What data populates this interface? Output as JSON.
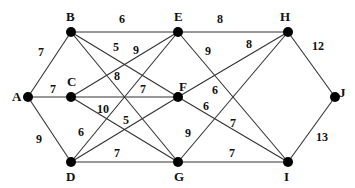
{
  "diagram": {
    "type": "weighted-undirected-graph",
    "nodes": [
      {
        "id": "A",
        "label": "A",
        "x": 28,
        "y": 97,
        "lx": 12,
        "ly": 101
      },
      {
        "id": "B",
        "label": "B",
        "x": 71,
        "y": 32,
        "lx": 66,
        "ly": 21
      },
      {
        "id": "C",
        "label": "C",
        "x": 71,
        "y": 97,
        "lx": 67,
        "ly": 86
      },
      {
        "id": "D",
        "label": "D",
        "x": 71,
        "y": 162,
        "lx": 66,
        "ly": 181
      },
      {
        "id": "E",
        "label": "E",
        "x": 178,
        "y": 32,
        "lx": 174,
        "ly": 21
      },
      {
        "id": "F",
        "label": "F",
        "x": 178,
        "y": 97,
        "lx": 179,
        "ly": 91
      },
      {
        "id": "G",
        "label": "G",
        "x": 178,
        "y": 162,
        "lx": 174,
        "ly": 181
      },
      {
        "id": "H",
        "label": "H",
        "x": 288,
        "y": 32,
        "lx": 280,
        "ly": 21
      },
      {
        "id": "I",
        "label": "I",
        "x": 288,
        "y": 162,
        "lx": 284,
        "ly": 181
      },
      {
        "id": "J",
        "label": "J",
        "x": 335,
        "y": 97,
        "lx": 339,
        "ly": 97
      }
    ],
    "edges": [
      {
        "from": "A",
        "to": "B",
        "weight": "7",
        "lx": 38,
        "ly": 56
      },
      {
        "from": "A",
        "to": "C",
        "weight": "7",
        "lx": 50,
        "ly": 93
      },
      {
        "from": "A",
        "to": "D",
        "weight": "9",
        "lx": 36,
        "ly": 143
      },
      {
        "from": "B",
        "to": "E",
        "weight": "6",
        "lx": 119,
        "ly": 23
      },
      {
        "from": "B",
        "to": "F",
        "weight": "5",
        "lx": 113,
        "ly": 51
      },
      {
        "from": "B",
        "to": "G",
        "weight": "8",
        "lx": 114,
        "ly": 80
      },
      {
        "from": "C",
        "to": "E",
        "weight": "9",
        "lx": 133,
        "ly": 54
      },
      {
        "from": "C",
        "to": "F",
        "weight": "7",
        "lx": 140,
        "ly": 93
      },
      {
        "from": "C",
        "to": "G",
        "weight": "10",
        "lx": 97,
        "ly": 113
      },
      {
        "from": "D",
        "to": "E",
        "weight": "6",
        "lx": 78,
        "ly": 136
      },
      {
        "from": "D",
        "to": "F",
        "weight": "5",
        "lx": 123,
        "ly": 124
      },
      {
        "from": "D",
        "to": "G",
        "weight": "7",
        "lx": 114,
        "ly": 157
      },
      {
        "from": "E",
        "to": "H",
        "weight": "8",
        "lx": 217,
        "ly": 23
      },
      {
        "from": "E",
        "to": "I",
        "weight": "9",
        "lx": 205,
        "ly": 55
      },
      {
        "from": "F",
        "to": "H",
        "weight": "8",
        "lx": 246,
        "ly": 48
      },
      {
        "from": "G",
        "to": "H",
        "weight": "6",
        "lx": 212,
        "ly": 94
      },
      {
        "from": "F",
        "to": "I",
        "weight": "6",
        "lx": 203,
        "ly": 110
      },
      {
        "from": "F",
        "to": "I2",
        "weight": "7",
        "lx": 230,
        "ly": 127
      },
      {
        "from": "G",
        "to": "H2",
        "weight": "9",
        "lx": 185,
        "ly": 137
      },
      {
        "from": "G",
        "to": "I",
        "weight": "7",
        "lx": 229,
        "ly": 157
      },
      {
        "from": "H",
        "to": "J",
        "weight": "12",
        "lx": 312,
        "ly": 50
      },
      {
        "from": "I",
        "to": "J",
        "weight": "13",
        "lx": 316,
        "ly": 141
      }
    ]
  }
}
